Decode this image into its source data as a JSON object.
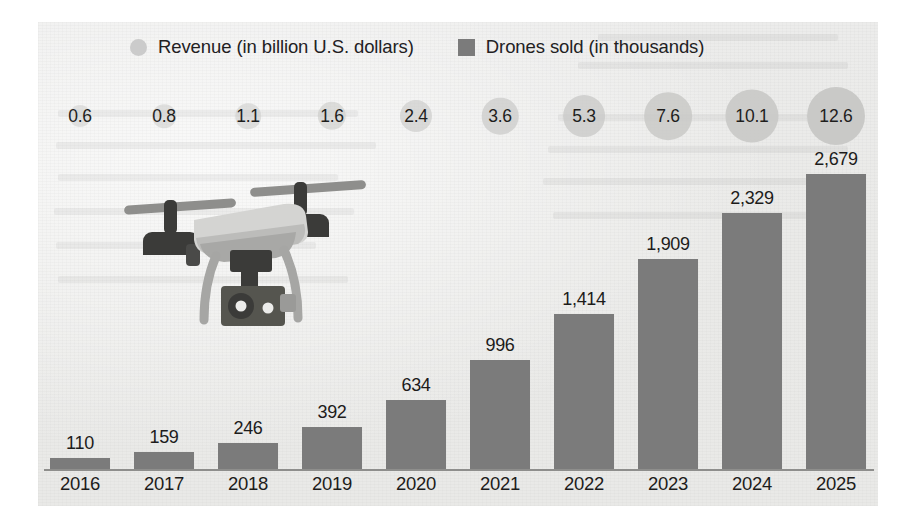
{
  "legend": {
    "items": [
      {
        "marker": "circle-marker",
        "label": "Revenue (in billion U.S. dollars)",
        "color": "#cbcbcb"
      },
      {
        "marker": "square-marker",
        "label": "Drones sold (in thousands)",
        "color": "#7b7b7b"
      }
    ]
  },
  "illustration": {
    "name": "quadcopter-drone",
    "body_color": "#c3c3c1",
    "motor_color": "#3a3a38",
    "accent_color": "#6d6d6b"
  },
  "chart_data": {
    "type": "bar",
    "title": "",
    "subtitle": "",
    "xlabel": "",
    "ylabel": "",
    "grid": false,
    "legend_position": "top",
    "categories": [
      "2016",
      "2017",
      "2018",
      "2019",
      "2020",
      "2021",
      "2022",
      "2023",
      "2024",
      "2025"
    ],
    "series": [
      {
        "name": "Drones sold (in thousands)",
        "type": "bar",
        "color": "#7b7b7b",
        "values": [
          110,
          159,
          246,
          392,
          634,
          996,
          1414,
          1909,
          2329,
          2679
        ],
        "labels": [
          "110",
          "159",
          "246",
          "392",
          "634",
          "996",
          "1,414",
          "1,909",
          "2,329",
          "2,679"
        ],
        "ylim": [
          0,
          2900
        ]
      },
      {
        "name": "Revenue (in billion U.S. dollars)",
        "type": "bubble",
        "color": "#c9c9c7",
        "values": [
          0.6,
          0.8,
          1.1,
          1.6,
          2.4,
          3.6,
          5.3,
          7.6,
          10.1,
          12.6
        ],
        "labels": [
          "0.6",
          "0.8",
          "1.1",
          "1.6",
          "2.4",
          "3.6",
          "5.3",
          "7.6",
          "10.1",
          "12.6"
        ]
      }
    ]
  }
}
